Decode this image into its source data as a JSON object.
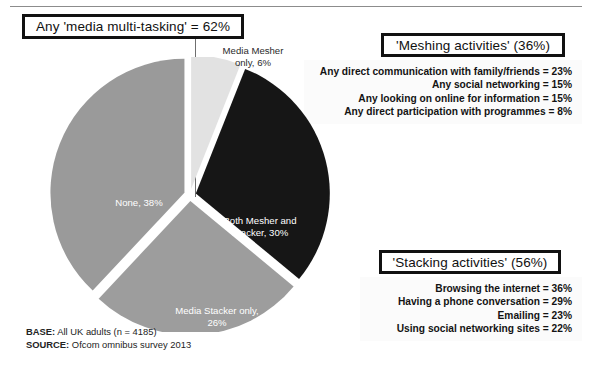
{
  "slide": {
    "main_title": "Any 'media multi-tasking' = 62%",
    "footer": {
      "base_label": "BASE:",
      "base_value": " All UK adults (n = 4185)",
      "source_label": "SOURCE:",
      "source_value": " Ofcom omnibus survey 2013"
    }
  },
  "callouts": [
    {
      "title": "'Meshing activities' (36%)",
      "lines": [
        "Any direct communication with family/friends = 23%",
        "Any social networking = 15%",
        "Any looking on online for information = 15%",
        "Any direct participation with programmes = 8%"
      ]
    },
    {
      "title": "'Stacking activities' (56%)",
      "lines": [
        "Browsing the internet  = 36%",
        "Having a phone conversation = 29%",
        "Emailing = 23%",
        "Using social networking sites = 22%"
      ]
    }
  ],
  "chart_data": {
    "type": "pie",
    "title": "Any 'media multi-tasking' = 62%",
    "categories": [
      "Media Mesher only",
      "Both Mesher and Stacker",
      "Media Stacker only",
      "None"
    ],
    "values": [
      6,
      30,
      26,
      38
    ],
    "unit": "%",
    "labels": [
      "Media Mesher\nonly, 6%",
      "Both Mesher and\nStacker, 30%",
      "Media Stacker only,\n26%",
      "None, 38%"
    ],
    "label_lines": {
      "mesher": [
        "Media Mesher",
        "only, 6%"
      ],
      "both": [
        "Both Mesher and",
        "Stacker, 30%"
      ],
      "stacker": [
        "Media Stacker only,",
        "26%"
      ],
      "none": [
        "None, 38%"
      ]
    },
    "colors": [
      "#e2e2e2",
      "#161616",
      "#9d9d9d",
      "#9a9a9a"
    ],
    "legend": "none",
    "exploded": true,
    "start_angle_deg": 0,
    "direction": "clockwise",
    "xlabel": "",
    "ylabel": ""
  },
  "colors": {
    "slice_mesher": "#e2e2e2",
    "slice_both": "#161616",
    "slice_stacker": "#9d9d9d",
    "slice_none": "#9a9a9a",
    "box_border": "#111111",
    "background": "#ffffff"
  }
}
